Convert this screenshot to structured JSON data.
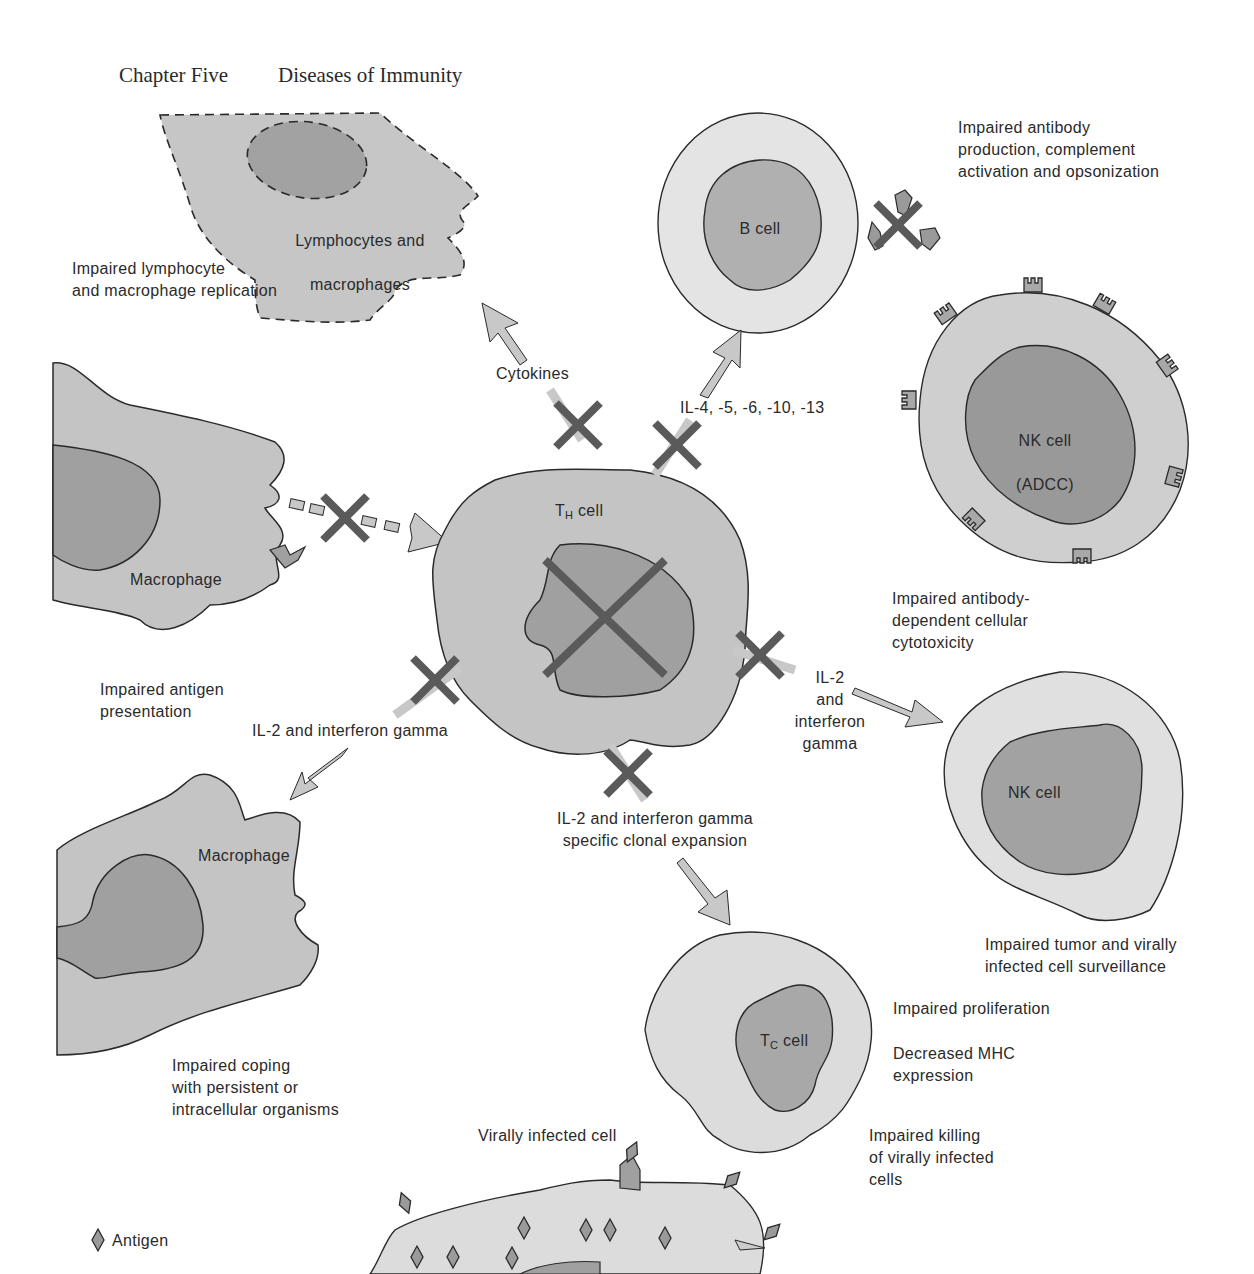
{
  "header": {
    "chapter": "Chapter Five",
    "title": "Diseases of Immunity"
  },
  "colors": {
    "cytoplasm": "#c4c4c4",
    "cytoplasm_light": "#dedede",
    "nucleus": "#9d9d9d",
    "x_mark": "#5a5a5a",
    "outline": "#2a2a2a",
    "arrow_fill": "#c8c8c8"
  },
  "cells": {
    "lymphocytes": {
      "label_line1": "Lymphocytes and",
      "label_line2": "macrophages"
    },
    "b_cell": {
      "label": "B cell"
    },
    "nk_adcc": {
      "label_line1": "NK cell",
      "label_line2": "(ADCC)"
    },
    "macrophage_top": {
      "label": "Macrophage"
    },
    "th_cell": {
      "label_main": "T",
      "label_sub": "H",
      "label_rest": " cell"
    },
    "macrophage_bottom": {
      "label": "Macrophage"
    },
    "nk_cell": {
      "label": "NK cell"
    },
    "tc_cell": {
      "label_main": "T",
      "label_sub": "C",
      "label_rest": " cell"
    },
    "virally_infected": {
      "label": "Virally infected cell"
    }
  },
  "signals": {
    "cytokines": "Cytokines",
    "il_b": "IL-4, -5, -6, -10, -13",
    "il2_ifn_left": "IL-2 and interferon gamma",
    "il2_ifn_right": "IL-2\nand\ninterferon\ngamma",
    "il2_ifn_clonal": "IL-2 and interferon gamma\nspecific clonal expansion"
  },
  "effects": {
    "lymph_replication": "Impaired lymphocyte\nand macrophage replication",
    "antibody": "Impaired antibody\nproduction, complement\nactivation and opsonization",
    "adcc": "Impaired antibody-\ndependent cellular\ncytotoxicity",
    "antigen_presentation": "Impaired antigen\npresentation",
    "tumor_surveillance": "Impaired tumor and virally\ninfected cell surveillance",
    "proliferation": "Impaired proliferation",
    "mhc": "Decreased MHC\nexpression",
    "killing": "Impaired killing\nof virally infected\ncells",
    "coping": "Impaired coping\nwith persistent or\nintracellular organisms"
  },
  "legend": {
    "antigen": "Antigen"
  }
}
